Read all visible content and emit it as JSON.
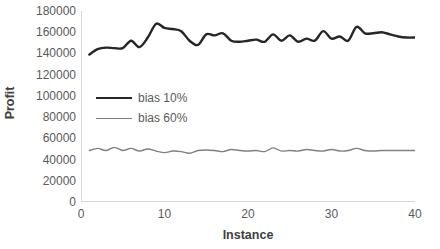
{
  "chart_data": {
    "type": "line",
    "title": "",
    "xlabel": "Instance",
    "ylabel": "Profit",
    "xlim": [
      0,
      40
    ],
    "ylim": [
      0,
      180000
    ],
    "grid": false,
    "legend_position": "inside-left-middle",
    "yticks": [
      "180000",
      "160000",
      "140000",
      "120000",
      "100000",
      "80000",
      "60000",
      "40000",
      "20000",
      "0"
    ],
    "ytick_values": [
      180000,
      160000,
      140000,
      120000,
      100000,
      80000,
      60000,
      40000,
      20000,
      0
    ],
    "xticks": [
      "0",
      "10",
      "20",
      "30",
      "40"
    ],
    "xtick_values": [
      0,
      10,
      20,
      30,
      40
    ],
    "x": [
      1,
      2,
      3,
      4,
      5,
      6,
      7,
      8,
      9,
      10,
      11,
      12,
      13,
      14,
      15,
      16,
      17,
      18,
      19,
      20,
      21,
      22,
      23,
      24,
      25,
      26,
      27,
      28,
      29,
      30,
      31,
      32,
      33,
      34,
      35,
      36,
      37,
      38,
      39,
      40
    ],
    "series": [
      {
        "name": "bias 10%",
        "color": "#262626",
        "width": 2.4,
        "values": [
          139000,
          144000,
          145500,
          145000,
          145000,
          152000,
          146000,
          155000,
          168000,
          164000,
          163000,
          161000,
          152000,
          148000,
          158000,
          157000,
          159000,
          152000,
          151000,
          152000,
          153000,
          151000,
          158000,
          152000,
          157000,
          151000,
          154000,
          152000,
          161000,
          154000,
          156000,
          152000,
          165000,
          159000,
          159000,
          160000,
          158000,
          156000,
          155000,
          155000
        ]
      },
      {
        "name": "bias 60%",
        "color": "#808080",
        "width": 1.4,
        "values": [
          48500,
          50500,
          48500,
          51500,
          48500,
          50500,
          48000,
          50000,
          48000,
          46500,
          48000,
          47500,
          46000,
          48500,
          49000,
          48500,
          47500,
          49500,
          48500,
          48000,
          48500,
          47500,
          51000,
          48000,
          48500,
          48000,
          49500,
          48500,
          48000,
          49500,
          48000,
          48500,
          50500,
          48500,
          48000,
          48500,
          48500,
          48500,
          48500,
          48500
        ]
      }
    ]
  }
}
